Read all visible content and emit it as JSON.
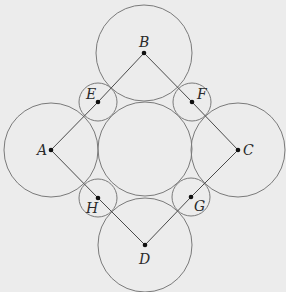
{
  "figure": {
    "background": "#ececec",
    "stroke_color": "#7a7a7a",
    "line_color": "#4a4a4a",
    "point_color": "#111111",
    "large_circles": [
      {
        "id": "A",
        "cx": 51,
        "cy": 150,
        "r": 47
      },
      {
        "id": "B",
        "cx": 144,
        "cy": 53,
        "r": 48
      },
      {
        "id": "C",
        "cx": 238,
        "cy": 150,
        "r": 47
      },
      {
        "id": "D",
        "cx": 145,
        "cy": 245,
        "r": 47
      },
      {
        "id": "center",
        "cx": 145,
        "cy": 149,
        "r": 47
      }
    ],
    "small_circles": [
      {
        "id": "E",
        "cx": 98,
        "cy": 102,
        "r": 19
      },
      {
        "id": "F",
        "cx": 192,
        "cy": 102,
        "r": 19
      },
      {
        "id": "G",
        "cx": 191,
        "cy": 197,
        "r": 19
      },
      {
        "id": "H",
        "cx": 98,
        "cy": 198,
        "r": 19
      }
    ],
    "segments": [
      [
        "A",
        "E"
      ],
      [
        "E",
        "B"
      ],
      [
        "B",
        "F"
      ],
      [
        "F",
        "C"
      ],
      [
        "C",
        "G"
      ],
      [
        "G",
        "D"
      ],
      [
        "D",
        "H"
      ],
      [
        "H",
        "A"
      ]
    ],
    "points": {
      "A": {
        "x": 51,
        "y": 150,
        "label": "A",
        "lx": 37,
        "ly": 155
      },
      "B": {
        "x": 144,
        "y": 53,
        "label": "B",
        "lx": 139,
        "ly": 47
      },
      "C": {
        "x": 238,
        "y": 150,
        "label": "C",
        "lx": 243,
        "ly": 155
      },
      "D": {
        "x": 145,
        "y": 245,
        "label": "D",
        "lx": 139,
        "ly": 264
      },
      "E": {
        "x": 98,
        "y": 102,
        "label": "E",
        "lx": 86,
        "ly": 99
      },
      "F": {
        "x": 192,
        "y": 102,
        "label": "F",
        "lx": 197,
        "ly": 99
      },
      "G": {
        "x": 191,
        "y": 197,
        "label": "G",
        "lx": 194,
        "ly": 211
      },
      "H": {
        "x": 98,
        "y": 198,
        "label": "H",
        "lx": 86,
        "ly": 213
      }
    }
  }
}
